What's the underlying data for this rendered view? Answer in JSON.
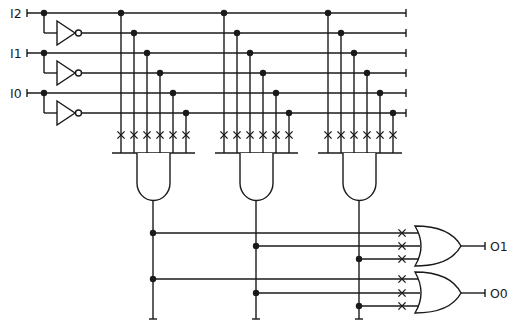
{
  "diagram": {
    "inputs": [
      {
        "label": "I2",
        "y": 13,
        "inv_y": 33
      },
      {
        "label": "I1",
        "y": 53,
        "inv_y": 73
      },
      {
        "label": "I0",
        "y": 93,
        "inv_y": 113
      }
    ],
    "outputs": [
      {
        "label": "O1",
        "inputs_y": [
          233,
          246,
          259
        ],
        "out_y": 246
      },
      {
        "label": "O0",
        "inputs_y": [
          279,
          293,
          306
        ],
        "out_y": 293
      }
    ],
    "and_gates": [
      {
        "name": "and-gate-1",
        "columns_x": [
          121,
          134,
          147,
          160,
          173,
          186
        ],
        "bar": [
          112,
          195
        ],
        "body": [
          137,
          170
        ],
        "out_x": 153
      },
      {
        "name": "and-gate-2",
        "columns_x": [
          224,
          237,
          250,
          263,
          276,
          289
        ],
        "bar": [
          215,
          298
        ],
        "body": [
          240,
          273
        ],
        "out_x": 256
      },
      {
        "name": "and-gate-3",
        "columns_x": [
          328,
          341,
          354,
          367,
          380,
          393
        ],
        "bar": [
          318,
          402
        ],
        "body": [
          343,
          376
        ],
        "out_x": 359
      }
    ],
    "line_end_x": 406,
    "fuse_x_row_y": 135,
    "or_fuse_x": 402,
    "product_lines_to_or": {
      "O1": [
        {
          "from_x": 153,
          "y": 233
        },
        {
          "from_x": 256,
          "y": 246
        },
        {
          "from_x": 359,
          "y": 259
        }
      ],
      "O0": [
        {
          "from_x": 153,
          "y": 279
        },
        {
          "from_x": 256,
          "y": 293
        },
        {
          "from_x": 359,
          "y": 306
        }
      ]
    },
    "colors": {
      "ink": "#1a1a1a",
      "background": "#ffffff"
    }
  }
}
